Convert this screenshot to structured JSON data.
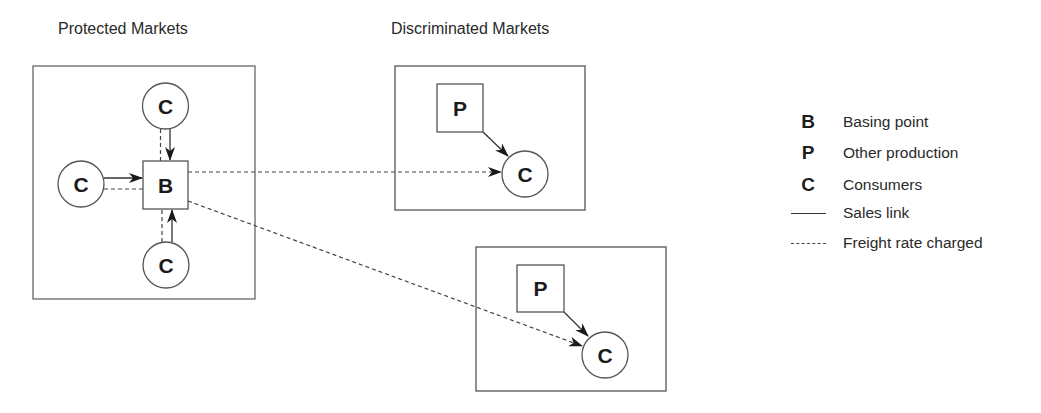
{
  "titles": {
    "protected": "Protected Markets",
    "discriminated": "Discriminated Markets"
  },
  "nodes": {
    "basing_point": "B",
    "consumer": "C",
    "other_production": "P"
  },
  "protected_market": {
    "basing_point": {
      "label": "B"
    },
    "consumers": [
      {
        "position": "top",
        "label": "C"
      },
      {
        "position": "left",
        "label": "C"
      },
      {
        "position": "bottom",
        "label": "C"
      }
    ]
  },
  "discriminated_markets": [
    {
      "producer": {
        "label": "P"
      },
      "consumer": {
        "label": "C"
      }
    },
    {
      "producer": {
        "label": "P"
      },
      "consumer": {
        "label": "C"
      }
    }
  ],
  "legend": {
    "items": [
      {
        "symbol": "B",
        "label": "Basing point"
      },
      {
        "symbol": "P",
        "label": "Other production"
      },
      {
        "symbol": "C",
        "label": "Consumers"
      },
      {
        "symbol": "solid-line",
        "label": "Sales link"
      },
      {
        "symbol": "dashed-line",
        "label": "Freight rate charged"
      }
    ]
  },
  "colors": {
    "stroke": "#555555",
    "text": "#222222",
    "background": "#ffffff"
  }
}
